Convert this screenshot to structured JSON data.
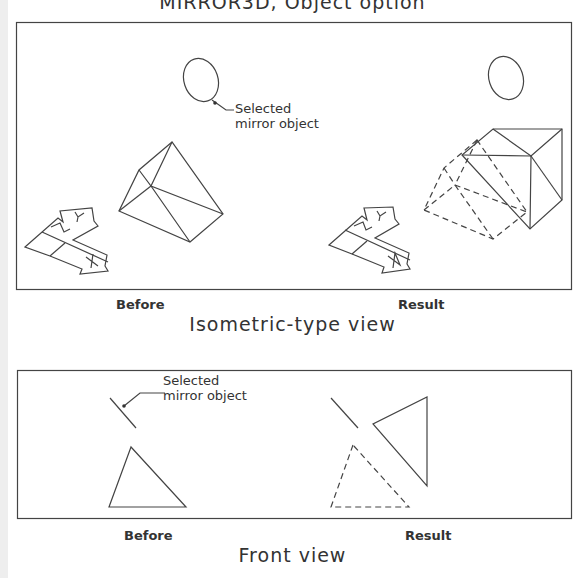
{
  "title": "MIRROR3D, Object option",
  "isometric": {
    "callout": [
      "Selected",
      "mirror object"
    ],
    "before_label": "Before",
    "result_label": "Result",
    "caption": "Isometric-type view"
  },
  "front": {
    "callout": [
      "Selected",
      "mirror object"
    ],
    "before_label": "Before",
    "result_label": "Result",
    "caption": "Front view"
  },
  "colors": {
    "line": "#333333",
    "background": "#ffffff"
  }
}
